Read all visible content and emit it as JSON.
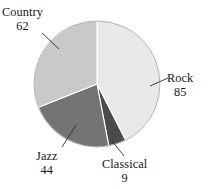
{
  "chart_data": {
    "type": "pie",
    "title": "",
    "subtitle": "",
    "xlabel": "",
    "ylabel": "",
    "total": 200,
    "legend_position": "none",
    "grid": false,
    "start_angle_deg": 0,
    "direction": "clockwise",
    "categories": [
      "Rock",
      "Classical",
      "Jazz",
      "Country"
    ],
    "values": [
      85,
      9,
      44,
      62
    ],
    "slices": [
      {
        "label": "Rock",
        "value": "85",
        "numeric": 85,
        "color": "#e9e9e9",
        "sweep_deg": 153.0,
        "start_deg": 0.0,
        "label_x": 178,
        "label_y": 72,
        "leader": {
          "x1": 150,
          "y1": 86,
          "x2": 168,
          "y2": 78
        }
      },
      {
        "label": "Classical",
        "value": "9",
        "numeric": 9,
        "color": "#4b4b4b",
        "sweep_deg": 16.2,
        "start_deg": 153.0,
        "label_x": 128,
        "label_y": 162,
        "leader": {
          "x1": 112,
          "y1": 141,
          "x2": 124,
          "y2": 156
        }
      },
      {
        "label": "Jazz",
        "value": "44",
        "numeric": 44,
        "color": "#747474",
        "sweep_deg": 79.2,
        "start_deg": 169.2,
        "label_x": 52,
        "label_y": 154,
        "leader": {
          "x1": 76,
          "y1": 125,
          "x2": 62,
          "y2": 147
        }
      },
      {
        "label": "Country",
        "value": "62",
        "numeric": 62,
        "color": "#c9c9c9",
        "sweep_deg": 111.6,
        "start_deg": 248.4,
        "label_x": 30,
        "label_y": 12,
        "leader": {
          "x1": 42,
          "y1": 33,
          "x2": 59,
          "y2": 49
        }
      }
    ],
    "geometry": {
      "cx": 97,
      "cy": 84,
      "r": 63
    },
    "colors": {
      "rock": "#e9e9e9",
      "classical": "#4b4b4b",
      "jazz": "#747474",
      "country": "#c9c9c9",
      "outline": "#9a9a9a",
      "leader": "#2b2b2b",
      "text": "#151515",
      "background": "#ffffff"
    }
  }
}
